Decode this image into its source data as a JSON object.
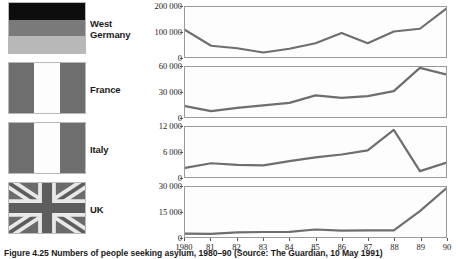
{
  "figure": {
    "caption": "Figure 4.25  Numbers of people seeking asylum, 1980–90 (Source: The Guardian, 10 May 1991)"
  },
  "legend": {
    "rows": [
      {
        "country": "West\nGermany",
        "flag": "west-germany-flag"
      },
      {
        "country": "France",
        "flag": "france-flag"
      },
      {
        "country": "Italy",
        "flag": "italy-flag"
      },
      {
        "country": "UK",
        "flag": "uk-flag"
      }
    ]
  },
  "xaxis": {
    "ticks": [
      "1980",
      "81",
      "82",
      "83",
      "84",
      "85",
      "86",
      "87",
      "88",
      "89",
      "90"
    ]
  },
  "colors": {
    "line": "#6e6e6e",
    "frame": "#9a9a9a",
    "flag_dark": "#0d0d0d",
    "flag_mid": "#7a7a7a",
    "flag_light": "#b8b8b8",
    "flag_white": "#fdfdfd",
    "uk_field": "#6b6b6b"
  },
  "chart_data": [
    {
      "type": "line",
      "title": "West Germany",
      "xlabel": "",
      "ylabel": "",
      "ylim": [
        0,
        200000
      ],
      "yticks": [
        0,
        100000,
        200000
      ],
      "ytick_labels": [
        "0",
        "100 000",
        "200 000"
      ],
      "grid": false,
      "x": [
        "1980",
        "81",
        "82",
        "83",
        "84",
        "85",
        "86",
        "87",
        "88",
        "89",
        "90"
      ],
      "values": [
        108000,
        45000,
        35000,
        18000,
        33000,
        55000,
        96000,
        55000,
        102000,
        113000,
        193000
      ]
    },
    {
      "type": "line",
      "title": "France",
      "xlabel": "",
      "ylabel": "",
      "ylim": [
        0,
        60000
      ],
      "yticks": [
        0,
        30000,
        60000
      ],
      "ytick_labels": [
        "0",
        "30 000",
        "60 000"
      ],
      "grid": false,
      "x": [
        "1980",
        "81",
        "82",
        "83",
        "84",
        "85",
        "86",
        "87",
        "88",
        "89",
        "90"
      ],
      "values": [
        13000,
        7000,
        11000,
        14000,
        17000,
        26000,
        23000,
        25000,
        31000,
        59000,
        51000
      ]
    },
    {
      "type": "line",
      "title": "Italy",
      "xlabel": "",
      "ylabel": "",
      "ylim": [
        0,
        12000
      ],
      "yticks": [
        0,
        6000,
        12000
      ],
      "ytick_labels": [
        "0",
        "6 000",
        "12 000"
      ],
      "grid": false,
      "x": [
        "1980",
        "81",
        "82",
        "83",
        "84",
        "85",
        "86",
        "87",
        "88",
        "89",
        "90"
      ],
      "values": [
        2200,
        3300,
        2900,
        2800,
        3800,
        4700,
        5400,
        6400,
        11300,
        1400,
        3400
      ]
    },
    {
      "type": "line",
      "title": "UK",
      "xlabel": "",
      "ylabel": "",
      "ylim": [
        0,
        30000
      ],
      "yticks": [
        0,
        15000,
        30000
      ],
      "ytick_labels": [
        "0",
        "15 000",
        "30 000"
      ],
      "grid": false,
      "x": [
        "1980",
        "81",
        "82",
        "83",
        "84",
        "85",
        "86",
        "87",
        "88",
        "89",
        "90"
      ],
      "values": [
        2000,
        1900,
        2800,
        3000,
        3100,
        4500,
        3800,
        4000,
        4000,
        15500,
        29000
      ]
    }
  ]
}
